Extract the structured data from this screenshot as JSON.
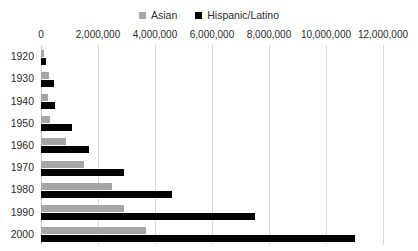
{
  "chart_data": {
    "type": "bar",
    "orientation": "horizontal",
    "title": "",
    "xlabel": "",
    "ylabel": "",
    "categories": [
      "1920",
      "1930",
      "1940",
      "1950",
      "1960",
      "1970",
      "1980",
      "1990",
      "2000"
    ],
    "series": [
      {
        "name": "Asian",
        "color": "#a6a6a6",
        "values": [
          110000,
          270000,
          255000,
          320000,
          890000,
          1500000,
          2500000,
          2900000,
          3700000
        ]
      },
      {
        "name": "Hispanic/Latino",
        "color": "#000000",
        "values": [
          180000,
          450000,
          480000,
          1100000,
          1700000,
          2900000,
          4600000,
          7500000,
          11000000
        ]
      }
    ],
    "xlim": [
      0,
      12000000
    ],
    "xticks": [
      0,
      2000000,
      4000000,
      6000000,
      8000000,
      10000000,
      12000000
    ],
    "xtick_labels": [
      "0",
      "2,000,000",
      "4,000,000",
      "6,000,000",
      "8,000,000",
      "10,000,000",
      "12,000,000"
    ],
    "grid": true,
    "grid_axis": "x",
    "legend_position": "top-center",
    "background_color": "#ffffff",
    "gridline_color": "#d9d9d9"
  },
  "legend": {
    "entries": [
      {
        "label": "Asian"
      },
      {
        "label": "Hispanic/Latino"
      }
    ]
  }
}
